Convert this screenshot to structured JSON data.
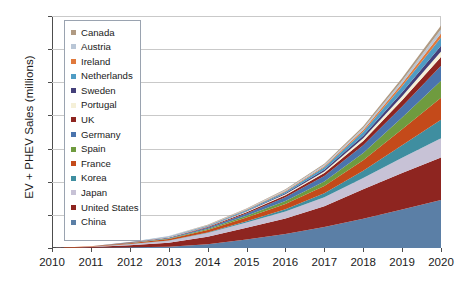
{
  "chart_data": {
    "type": "area",
    "stacked": true,
    "title": "",
    "xlabel": "",
    "ylabel": "EV + PHEV Sales (millions)",
    "x": [
      2010,
      2011,
      2012,
      2013,
      2014,
      2015,
      2016,
      2017,
      2018,
      2019,
      2020
    ],
    "xtick_labels": [
      "2010",
      "2011",
      "2012",
      "2013",
      "2014",
      "2015",
      "2016",
      "2017",
      "2018",
      "2019",
      "2020"
    ],
    "xlim": [
      2010,
      2020
    ],
    "ylim": [
      0.0,
      7.0
    ],
    "ytick_labels": [
      "0.0",
      "1.0",
      "2.0",
      "3.0",
      "4.0",
      "5.0",
      "6.0",
      "7.0"
    ],
    "ytick_values": [
      0.0,
      1.0,
      2.0,
      3.0,
      4.0,
      5.0,
      6.0,
      7.0
    ],
    "grid": true,
    "legend_position": "upper left",
    "stack_order_bottom_to_top": [
      "China",
      "United States",
      "Japan",
      "Korea",
      "France",
      "Spain",
      "Germany",
      "UK",
      "Portugal",
      "Sweden",
      "Netherlands",
      "Ireland",
      "Austria",
      "Canada"
    ],
    "series": [
      {
        "name": "China",
        "color": "#5b7fa6",
        "values": [
          0.0,
          0.01,
          0.02,
          0.04,
          0.11,
          0.26,
          0.42,
          0.63,
          0.88,
          1.16,
          1.45
        ]
      },
      {
        "name": "United States",
        "color": "#8e2520",
        "values": [
          0.0,
          0.02,
          0.06,
          0.12,
          0.23,
          0.35,
          0.47,
          0.63,
          0.89,
          1.1,
          1.28
        ]
      },
      {
        "name": "Japan",
        "color": "#c7c2d6",
        "values": [
          0.0,
          0.01,
          0.03,
          0.06,
          0.11,
          0.16,
          0.21,
          0.27,
          0.34,
          0.46,
          0.58
        ]
      },
      {
        "name": "Korea",
        "color": "#3f8ea0",
        "values": [
          0.0,
          0.0,
          0.01,
          0.01,
          0.02,
          0.04,
          0.07,
          0.12,
          0.22,
          0.38,
          0.56
        ]
      },
      {
        "name": "France",
        "color": "#c44a1a",
        "values": [
          0.0,
          0.01,
          0.02,
          0.04,
          0.07,
          0.11,
          0.16,
          0.22,
          0.32,
          0.48,
          0.66
        ]
      },
      {
        "name": "Spain",
        "color": "#6f9b3f",
        "values": [
          0.0,
          0.0,
          0.01,
          0.02,
          0.03,
          0.05,
          0.09,
          0.14,
          0.22,
          0.36,
          0.52
        ]
      },
      {
        "name": "Germany",
        "color": "#4a74ad",
        "values": [
          0.0,
          0.0,
          0.01,
          0.02,
          0.04,
          0.07,
          0.11,
          0.16,
          0.23,
          0.33,
          0.45
        ]
      },
      {
        "name": "UK",
        "color": "#8e2520",
        "values": [
          0.0,
          0.0,
          0.01,
          0.01,
          0.02,
          0.04,
          0.06,
          0.09,
          0.13,
          0.19,
          0.26
        ]
      },
      {
        "name": "Portugal",
        "color": "#f5f0d8",
        "values": [
          0.0,
          0.0,
          0.0,
          0.01,
          0.01,
          0.02,
          0.03,
          0.05,
          0.08,
          0.12,
          0.17
        ]
      },
      {
        "name": "Sweden",
        "color": "#44407a",
        "values": [
          0.0,
          0.0,
          0.0,
          0.01,
          0.01,
          0.02,
          0.03,
          0.05,
          0.08,
          0.12,
          0.17
        ]
      },
      {
        "name": "Netherlands",
        "color": "#4f9cc4",
        "values": [
          0.0,
          0.0,
          0.01,
          0.01,
          0.02,
          0.03,
          0.05,
          0.08,
          0.12,
          0.18,
          0.25
        ]
      },
      {
        "name": "Ireland",
        "color": "#e0793c",
        "values": [
          0.0,
          0.0,
          0.0,
          0.0,
          0.01,
          0.01,
          0.02,
          0.03,
          0.05,
          0.08,
          0.12
        ]
      },
      {
        "name": "Austria",
        "color": "#b9c6d6",
        "values": [
          0.0,
          0.0,
          0.0,
          0.01,
          0.01,
          0.02,
          0.03,
          0.04,
          0.06,
          0.09,
          0.13
        ]
      },
      {
        "name": "Canada",
        "color": "#b09a82",
        "values": [
          0.0,
          0.0,
          0.0,
          0.0,
          0.01,
          0.01,
          0.02,
          0.03,
          0.05,
          0.08,
          0.11
        ]
      }
    ],
    "totals": [
      0.0,
      0.05,
      0.18,
      0.36,
      0.7,
      1.19,
      1.77,
      2.54,
      3.67,
      5.13,
      6.71
    ]
  },
  "legend": {
    "items": [
      {
        "label": "Canada",
        "color": "#b09a82"
      },
      {
        "label": "Austria",
        "color": "#b9c6d6"
      },
      {
        "label": "Ireland",
        "color": "#e0793c"
      },
      {
        "label": "Netherlands",
        "color": "#4f9cc4"
      },
      {
        "label": "Sweden",
        "color": "#44407a"
      },
      {
        "label": "Portugal",
        "color": "#f5f0d8"
      },
      {
        "label": "UK",
        "color": "#8e2520"
      },
      {
        "label": "Germany",
        "color": "#4a74ad"
      },
      {
        "label": "Spain",
        "color": "#6f9b3f"
      },
      {
        "label": "France",
        "color": "#c44a1a"
      },
      {
        "label": "Korea",
        "color": "#3f8ea0"
      },
      {
        "label": "Japan",
        "color": "#c7c2d6"
      },
      {
        "label": "United States",
        "color": "#8e2520"
      },
      {
        "label": "China",
        "color": "#5b7fa6"
      }
    ]
  }
}
